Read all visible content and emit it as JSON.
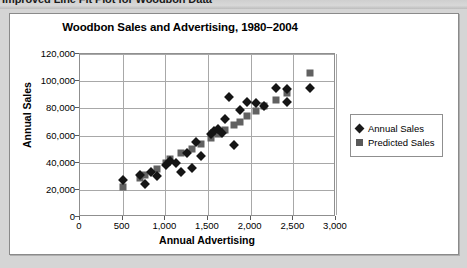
{
  "document": {
    "heading": "Improved Line Fit Plot for Woodbon Data"
  },
  "legend": {
    "position": "right",
    "items": [
      {
        "label": "Annual Sales",
        "marker": "diamond-marker-icon",
        "color": "#151515"
      },
      {
        "label": "Predicted Sales",
        "marker": "square-marker-icon",
        "color": "#616161"
      }
    ]
  },
  "chart_data": {
    "type": "scatter",
    "title": "Woodbon Sales and Advertising, 1980–2004",
    "xlabel": "Annual Advertising",
    "ylabel": "Annual Sales",
    "xlim": [
      0,
      3000
    ],
    "ylim": [
      0,
      120000
    ],
    "xticks": [
      "0",
      "500",
      "1,000",
      "1,500",
      "2,000",
      "2,500",
      "3,000"
    ],
    "xtick_values": [
      0,
      500,
      1000,
      1500,
      2000,
      2500,
      3000
    ],
    "yticks": [
      "0",
      "20,000",
      "40,000",
      "60,000",
      "80,000",
      "100,000",
      "120,000"
    ],
    "ytick_values": [
      0,
      20000,
      40000,
      60000,
      80000,
      100000,
      120000
    ],
    "grid": true,
    "series": [
      {
        "name": "Annual Sales",
        "marker": "diamond",
        "color": "#151515",
        "points": [
          [
            505,
            27000
          ],
          [
            700,
            31000
          ],
          [
            760,
            24000
          ],
          [
            830,
            33000
          ],
          [
            900,
            30000
          ],
          [
            1010,
            38000
          ],
          [
            1060,
            41000
          ],
          [
            1120,
            40000
          ],
          [
            1180,
            33000
          ],
          [
            1250,
            47000
          ],
          [
            1310,
            36000
          ],
          [
            1360,
            55000
          ],
          [
            1420,
            45000
          ],
          [
            1530,
            61000
          ],
          [
            1570,
            63000
          ],
          [
            1620,
            65000
          ],
          [
            1660,
            62000
          ],
          [
            1700,
            72000
          ],
          [
            1750,
            88000
          ],
          [
            1800,
            53000
          ],
          [
            1880,
            79000
          ],
          [
            1960,
            85000
          ],
          [
            2060,
            84000
          ],
          [
            2160,
            82000
          ],
          [
            2300,
            95000
          ],
          [
            2420,
            94000
          ],
          [
            2430,
            85000
          ],
          [
            2700,
            95000
          ]
        ]
      },
      {
        "name": "Predicted Sales",
        "marker": "square",
        "color": "#616161",
        "points": [
          [
            505,
            22000
          ],
          [
            700,
            29000
          ],
          [
            760,
            31000
          ],
          [
            900,
            35000
          ],
          [
            1010,
            40000
          ],
          [
            1060,
            43000
          ],
          [
            1180,
            47000
          ],
          [
            1310,
            50000
          ],
          [
            1420,
            54000
          ],
          [
            1530,
            58000
          ],
          [
            1620,
            61000
          ],
          [
            1700,
            64000
          ],
          [
            1800,
            68000
          ],
          [
            1880,
            70000
          ],
          [
            1960,
            74000
          ],
          [
            2060,
            78000
          ],
          [
            2160,
            82000
          ],
          [
            2300,
            86000
          ],
          [
            2420,
            91000
          ],
          [
            2700,
            106000
          ]
        ]
      }
    ]
  }
}
